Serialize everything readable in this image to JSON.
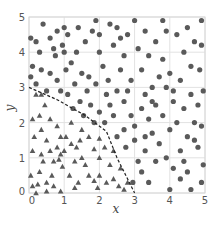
{
  "chart_data": {
    "type": "scatter",
    "title": "",
    "xlabel": "x",
    "ylabel": "y",
    "xlim": [
      0,
      5
    ],
    "ylim": [
      0,
      5
    ],
    "xticks": [
      "0",
      "1",
      "2",
      "3",
      "4",
      "5"
    ],
    "yticks": [
      "0",
      "1",
      "2",
      "3",
      "4",
      "5"
    ],
    "grid": true,
    "legend": null,
    "colors": {
      "points": "#5a5a5a",
      "grid": "#e2e2e2",
      "boundary": "#222222"
    },
    "boundary": {
      "style": "dashed",
      "points": [
        [
          0,
          3.0
        ],
        [
          0.8,
          2.65
        ],
        [
          1.6,
          2.2
        ],
        [
          2.2,
          1.75
        ],
        [
          2.5,
          1.0
        ],
        [
          3.0,
          0.0
        ]
      ]
    },
    "series": [
      {
        "name": "inside region",
        "marker": "triangle",
        "points": [
          [
            0.1,
            2.1
          ],
          [
            0.2,
            2.8
          ],
          [
            0.35,
            2.8
          ],
          [
            0.45,
            2.5
          ],
          [
            0.3,
            2.2
          ],
          [
            0.15,
            1.6
          ],
          [
            0.35,
            1.8
          ],
          [
            0.5,
            1.5
          ],
          [
            0.1,
            1.2
          ],
          [
            0.35,
            1.1
          ],
          [
            0.4,
            0.9
          ],
          [
            0.3,
            0.6
          ],
          [
            0.25,
            0.25
          ],
          [
            0.1,
            0.2
          ],
          [
            0.5,
            0.3
          ],
          [
            0.65,
            0.5
          ],
          [
            0.7,
            0.9
          ],
          [
            0.6,
            1.2
          ],
          [
            0.8,
            1.3
          ],
          [
            0.9,
            1.1
          ],
          [
            0.85,
            0.95
          ],
          [
            0.95,
            0.75
          ],
          [
            0.7,
            0.2
          ],
          [
            0.9,
            0.05
          ],
          [
            1.05,
            1.6
          ],
          [
            0.9,
            1.6
          ],
          [
            1.0,
            1.2
          ],
          [
            1.2,
            1.4
          ],
          [
            1.35,
            1.3
          ],
          [
            1.45,
            1.5
          ],
          [
            1.5,
            1.0
          ],
          [
            1.6,
            0.8
          ],
          [
            1.3,
            0.9
          ],
          [
            1.15,
            0.5
          ],
          [
            1.4,
            0.3
          ],
          [
            1.7,
            0.5
          ],
          [
            1.85,
            0.35
          ],
          [
            2.0,
            0.5
          ],
          [
            2.2,
            0.3
          ],
          [
            2.4,
            0.4
          ],
          [
            2.55,
            0.2
          ],
          [
            2.7,
            0.1
          ],
          [
            2.3,
            0.8
          ],
          [
            2.4,
            1.2
          ],
          [
            2.0,
            1.0
          ],
          [
            1.85,
            1.25
          ],
          [
            1.7,
            1.6
          ],
          [
            2.0,
            1.55
          ],
          [
            1.2,
            2.0
          ],
          [
            0.6,
            2.1
          ],
          [
            0.8,
            1.9
          ],
          [
            1.5,
            1.8
          ],
          [
            1.3,
            0.15
          ],
          [
            0.05,
            0.5
          ],
          [
            0.2,
            0.0
          ],
          [
            2.8,
            0.3
          ],
          [
            2.15,
            1.3
          ],
          [
            1.95,
            0.15
          ],
          [
            2.6,
            0.7
          ],
          [
            0.5,
            0.05
          ]
        ]
      },
      {
        "name": "outside region",
        "marker": "circle",
        "points": [
          [
            0.05,
            4.4
          ],
          [
            0.2,
            4.3
          ],
          [
            0.4,
            4.8
          ],
          [
            0.3,
            4.0
          ],
          [
            0.1,
            3.6
          ],
          [
            0.35,
            3.5
          ],
          [
            0.05,
            3.3
          ],
          [
            0.6,
            3.4
          ],
          [
            0.7,
            4.1
          ],
          [
            0.8,
            4.6
          ],
          [
            0.75,
            3.9
          ],
          [
            1.0,
            4.7
          ],
          [
            1.1,
            4.5
          ],
          [
            0.95,
            4.2
          ],
          [
            1.2,
            3.7
          ],
          [
            1.05,
            3.5
          ],
          [
            0.8,
            3.2
          ],
          [
            0.9,
            2.9
          ],
          [
            1.35,
            4.0
          ],
          [
            1.5,
            3.4
          ],
          [
            1.7,
            3.3
          ],
          [
            1.6,
            4.3
          ],
          [
            1.8,
            4.6
          ],
          [
            1.9,
            4.9
          ],
          [
            2.0,
            4.0
          ],
          [
            2.1,
            3.6
          ],
          [
            1.9,
            3.1
          ],
          [
            1.65,
            2.9
          ],
          [
            1.45,
            2.6
          ],
          [
            1.75,
            2.5
          ],
          [
            2.0,
            2.3
          ],
          [
            2.15,
            2.0
          ],
          [
            2.3,
            2.5
          ],
          [
            2.25,
            3.2
          ],
          [
            2.5,
            4.7
          ],
          [
            2.4,
            4.2
          ],
          [
            2.6,
            4.4
          ],
          [
            2.8,
            4.5
          ],
          [
            2.7,
            3.9
          ],
          [
            2.6,
            3.5
          ],
          [
            2.9,
            3.2
          ],
          [
            2.5,
            2.9
          ],
          [
            2.7,
            2.6
          ],
          [
            2.9,
            2.2
          ],
          [
            2.5,
            1.6
          ],
          [
            2.75,
            1.3
          ],
          [
            2.7,
            1.8
          ],
          [
            3.0,
            1.5
          ],
          [
            3.1,
            0.9
          ],
          [
            3.2,
            0.6
          ],
          [
            3.4,
            0.3
          ],
          [
            3.3,
            1.2
          ],
          [
            3.5,
            1.7
          ],
          [
            3.4,
            2.1
          ],
          [
            3.6,
            2.5
          ],
          [
            3.3,
            2.8
          ],
          [
            3.5,
            3.0
          ],
          [
            3.2,
            3.5
          ],
          [
            3.4,
            3.9
          ],
          [
            3.6,
            4.3
          ],
          [
            3.3,
            4.6
          ],
          [
            3.8,
            4.9
          ],
          [
            3.9,
            4.6
          ],
          [
            3.8,
            3.8
          ],
          [
            4.0,
            3.4
          ],
          [
            3.9,
            3.0
          ],
          [
            4.1,
            2.6
          ],
          [
            3.8,
            2.2
          ],
          [
            4.0,
            1.8
          ],
          [
            3.7,
            1.4
          ],
          [
            3.9,
            1.0
          ],
          [
            4.1,
            0.7
          ],
          [
            4.3,
            0.4
          ],
          [
            4.0,
            0.1
          ],
          [
            4.5,
            0.6
          ],
          [
            4.3,
            1.2
          ],
          [
            4.5,
            1.6
          ],
          [
            4.7,
            2.0
          ],
          [
            4.4,
            2.4
          ],
          [
            4.6,
            2.8
          ],
          [
            4.3,
            3.2
          ],
          [
            4.6,
            3.6
          ],
          [
            4.4,
            4.0
          ],
          [
            4.7,
            4.3
          ],
          [
            4.5,
            4.7
          ],
          [
            4.9,
            4.9
          ],
          [
            4.9,
            4.2
          ],
          [
            4.85,
            3.5
          ],
          [
            4.95,
            2.9
          ],
          [
            4.8,
            2.5
          ],
          [
            4.9,
            1.9
          ],
          [
            4.8,
            1.3
          ],
          [
            4.95,
            0.8
          ],
          [
            4.9,
            0.3
          ],
          [
            4.6,
            0.1
          ],
          [
            4.2,
            2.0
          ],
          [
            3.2,
            2.4
          ],
          [
            3.0,
            1.9
          ],
          [
            2.95,
            0.3
          ],
          [
            3.6,
            0.9
          ],
          [
            2.2,
            2.8
          ],
          [
            1.3,
            3.1
          ],
          [
            0.5,
            2.9
          ],
          [
            0.2,
            3.1
          ],
          [
            1.1,
            2.8
          ],
          [
            1.55,
            2.2
          ],
          [
            1.85,
            2.0
          ],
          [
            2.4,
            2.2
          ],
          [
            3.7,
            3.3
          ],
          [
            4.2,
            4.5
          ],
          [
            3.1,
            4.1
          ],
          [
            2.3,
            4.8
          ],
          [
            1.4,
            4.7
          ],
          [
            0.6,
            4.4
          ],
          [
            1.25,
            2.4
          ],
          [
            2.8,
            2.9
          ],
          [
            3.5,
            2.6
          ],
          [
            4.1,
            2.9
          ],
          [
            4.7,
            1.5
          ],
          [
            3.3,
            1.6
          ],
          [
            4.4,
            0.9
          ],
          [
            3.0,
            4.9
          ],
          [
            2.0,
            4.5
          ],
          [
            1.0,
            4.0
          ]
        ]
      }
    ]
  }
}
